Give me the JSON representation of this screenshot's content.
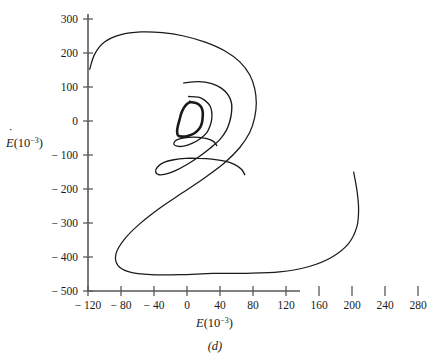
{
  "figure": {
    "caption": "(d)",
    "x_axis": {
      "label_base": "E",
      "label_paren_open": "(10",
      "label_exp": "−3",
      "label_paren_close": ")",
      "ticks": [
        -120,
        -80,
        -40,
        0,
        40,
        80,
        120,
        160,
        200,
        240,
        280
      ],
      "tick_labels": [
        "− 120",
        "− 80",
        "− 40",
        "0",
        "40",
        "80",
        "120",
        "160",
        "200",
        "240",
        "280"
      ],
      "min": -120,
      "max": 290
    },
    "y_axis": {
      "label_base": "E",
      "label_dot": "˙",
      "label_paren_open": "(10",
      "label_exp": "−3",
      "label_paren_close": ")",
      "ticks": [
        300,
        200,
        100,
        0,
        -100,
        -200,
        -300,
        -400,
        -500
      ],
      "tick_labels": [
        "300",
        "200",
        "100",
        "0",
        "− 100",
        "− 200",
        "− 300",
        "− 400",
        "− 500"
      ],
      "min": -500,
      "max": 330
    },
    "colors": {
      "curve": "#1a1a1a",
      "axis": "#555a5e",
      "background": "#ffffff"
    }
  },
  "chart_data": {
    "type": "line",
    "title": "",
    "subtitle": "(d)",
    "xlabel": "E(10^-3)",
    "ylabel": "Edot(10^-3)",
    "xlim": [
      -120,
      290
    ],
    "ylim": [
      -500,
      330
    ],
    "grid": false,
    "legend": null,
    "series": [
      {
        "name": "trajectory",
        "comment": "Inward spiral, ordered sequence of (E, Edot) points in data units",
        "points": [
          [
            -118,
            152
          ],
          [
            -112,
            196
          ],
          [
            -100,
            232
          ],
          [
            -80,
            254
          ],
          [
            -56,
            262
          ],
          [
            -30,
            260
          ],
          [
            -4,
            250
          ],
          [
            22,
            232
          ],
          [
            46,
            206
          ],
          [
            64,
            174
          ],
          [
            76,
            136
          ],
          [
            82,
            96
          ],
          [
            84,
            54
          ],
          [
            82,
            10
          ],
          [
            76,
            -34
          ],
          [
            64,
            -78
          ],
          [
            46,
            -122
          ],
          [
            22,
            -166
          ],
          [
            -6,
            -212
          ],
          [
            -34,
            -258
          ],
          [
            -58,
            -304
          ],
          [
            -76,
            -348
          ],
          [
            -86,
            -390
          ],
          [
            -84,
            -424
          ],
          [
            -70,
            -444
          ],
          [
            -44,
            -452
          ],
          [
            -8,
            -452
          ],
          [
            32,
            -448
          ],
          [
            72,
            -448
          ],
          [
            112,
            -444
          ],
          [
            148,
            -428
          ],
          [
            176,
            -400
          ],
          [
            196,
            -360
          ],
          [
            206,
            -310
          ],
          [
            208,
            -258
          ],
          [
            206,
            -204
          ],
          [
            202,
            -150
          ]
        ]
      },
      {
        "name": "second-orbit",
        "comment": "Second, smaller orbit of the spiral",
        "points": [
          [
            -4,
            112
          ],
          [
            14,
            116
          ],
          [
            30,
            110
          ],
          [
            42,
            96
          ],
          [
            50,
            76
          ],
          [
            54,
            52
          ],
          [
            54,
            26
          ],
          [
            52,
            0
          ],
          [
            48,
            -26
          ],
          [
            40,
            -54
          ],
          [
            28,
            -80
          ],
          [
            14,
            -106
          ],
          [
            0,
            -128
          ],
          [
            -14,
            -146
          ],
          [
            -26,
            -156
          ],
          [
            -34,
            -158
          ],
          [
            -38,
            -150
          ],
          [
            -36,
            -136
          ],
          [
            -28,
            -122
          ],
          [
            -16,
            -114
          ],
          [
            -2,
            -110
          ],
          [
            14,
            -110
          ],
          [
            30,
            -112
          ],
          [
            46,
            -118
          ],
          [
            58,
            -128
          ],
          [
            66,
            -142
          ],
          [
            70,
            -158
          ]
        ]
      },
      {
        "name": "third-orbit",
        "comment": "Third orbit approaching the limit cycle",
        "points": [
          [
            2,
            72
          ],
          [
            14,
            70
          ],
          [
            22,
            60
          ],
          [
            28,
            44
          ],
          [
            30,
            26
          ],
          [
            30,
            6
          ],
          [
            28,
            -14
          ],
          [
            24,
            -34
          ],
          [
            16,
            -52
          ],
          [
            6,
            -66
          ],
          [
            -4,
            -74
          ],
          [
            -12,
            -74
          ],
          [
            -16,
            -68
          ],
          [
            -14,
            -58
          ],
          [
            -8,
            -52
          ],
          [
            2,
            -48
          ],
          [
            14,
            -48
          ],
          [
            24,
            -52
          ],
          [
            32,
            -60
          ],
          [
            36,
            -72
          ]
        ]
      },
      {
        "name": "limit-cycle",
        "comment": "Innermost closed orbit (attracting limit cycle)",
        "points": [
          [
            4,
            56
          ],
          [
            12,
            52
          ],
          [
            17,
            42
          ],
          [
            19,
            28
          ],
          [
            19,
            12
          ],
          [
            18,
            -6
          ],
          [
            15,
            -22
          ],
          [
            9,
            -36
          ],
          [
            1,
            -44
          ],
          [
            -6,
            -46
          ],
          [
            -11,
            -42
          ],
          [
            -12,
            -30
          ],
          [
            -11,
            -14
          ],
          [
            -9,
            4
          ],
          [
            -7,
            22
          ],
          [
            -4,
            38
          ],
          [
            0,
            50
          ],
          [
            4,
            56
          ]
        ]
      }
    ]
  }
}
